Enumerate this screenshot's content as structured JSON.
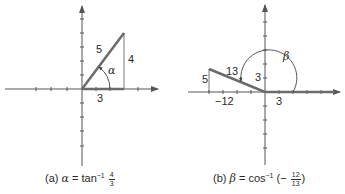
{
  "figure_a": {
    "caption_prefix": "(a)",
    "caption_var": "α",
    "caption_eq": " = tan",
    "caption_exp": "−1",
    "caption_num": "4",
    "caption_den": "3",
    "hyp_label": "5",
    "opp_label": "4",
    "adj_label": "3",
    "angle_label": "α"
  },
  "figure_b": {
    "caption_prefix": "(b)",
    "caption_var": "β",
    "caption_eq": " = cos",
    "caption_exp": "−1",
    "caption_open": " (−",
    "caption_num": "12",
    "caption_den": "13",
    "caption_close": ")",
    "hyp_label": "13",
    "opp_label": "5",
    "adj_label": "−12",
    "radius_label": "3",
    "x_label": "3",
    "angle_label": "β"
  },
  "colors": {
    "axis": "#555555",
    "terminal_side": "#6b6b6b",
    "text": "#2a2a2a"
  }
}
